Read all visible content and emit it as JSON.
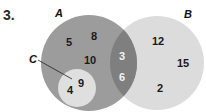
{
  "problem_number": "3.",
  "colors": {
    "set_a": "#9c9c9c",
    "set_b": "#dcdcdc",
    "overlap_ab": "#7f7f7f",
    "set_c": "#dfdfdf"
  },
  "sets": {
    "A": {
      "label": "A",
      "only_elements": [
        "5",
        "8",
        "10"
      ]
    },
    "B": {
      "label": "B",
      "only_elements": [
        "12",
        "15",
        "2"
      ]
    },
    "C": {
      "label": "C",
      "elements": [
        "9",
        "4"
      ]
    },
    "A_and_B": {
      "elements": [
        "3",
        "6"
      ]
    }
  },
  "labels": {
    "a": "A",
    "b": "B",
    "c": "C"
  },
  "elements": {
    "a5": "5",
    "a8": "8",
    "a10": "10",
    "c9": "9",
    "c4": "4",
    "ab3": "3",
    "ab6": "6",
    "b12": "12",
    "b15": "15",
    "b2": "2"
  }
}
